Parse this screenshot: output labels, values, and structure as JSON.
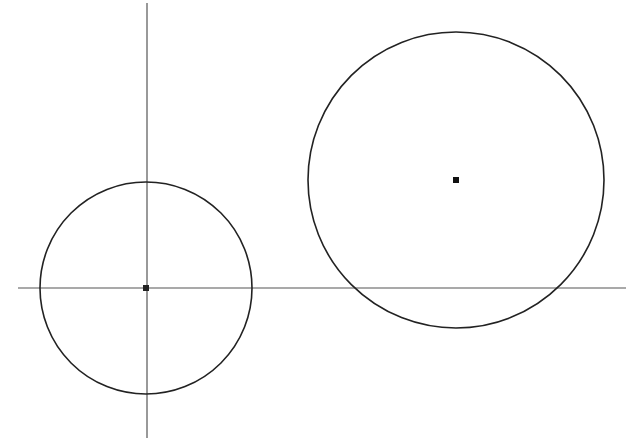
{
  "diagram": {
    "canvas": {
      "width": 635,
      "height": 447,
      "background": "#ffffff"
    },
    "axes": {
      "horizontal": {
        "x1": 18,
        "y1": 288,
        "x2": 626,
        "y2": 288,
        "color": "#555555"
      },
      "vertical": {
        "x1": 147,
        "y1": 3,
        "x2": 147,
        "y2": 438,
        "color": "#555555"
      }
    },
    "circles": [
      {
        "name": "small-circle",
        "cx": 146,
        "cy": 288,
        "r": 106,
        "stroke": "#222222"
      },
      {
        "name": "large-circle",
        "cx": 456,
        "cy": 180,
        "r": 148,
        "stroke": "#222222"
      }
    ],
    "center_points": [
      {
        "name": "small-circle-center",
        "x": 146,
        "y": 288,
        "size": 6,
        "color": "#222222"
      },
      {
        "name": "large-circle-center",
        "x": 456,
        "y": 180,
        "size": 6,
        "color": "#111111"
      }
    ]
  }
}
